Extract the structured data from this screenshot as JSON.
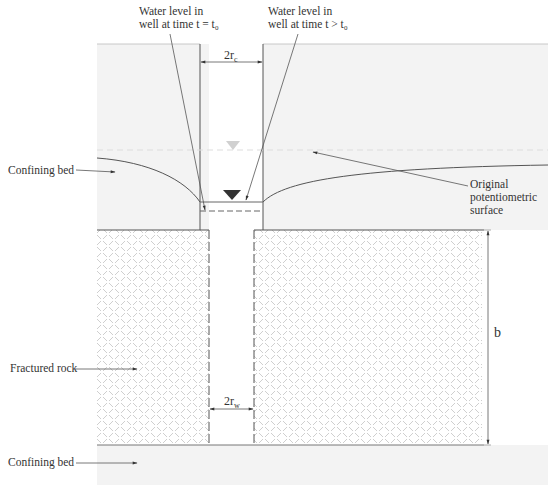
{
  "labels": {
    "water_level_t0_line1": "Water level in",
    "water_level_t0_line2": "well at time t = t₀",
    "water_level_t_line1": "Water level in",
    "water_level_t_line2": "well at time t > t₀",
    "casing_radius": "2r",
    "casing_radius_sub": "c",
    "well_radius": "2r",
    "well_radius_sub": "w",
    "confining_bed_top": "Confining bed",
    "confining_bed_bottom": "Confining bed",
    "original_surface_line1": "Original",
    "original_surface_line2": "potentiometric",
    "original_surface_line3": "surface",
    "fractured_rock": "Fractured rock",
    "aquifer_thickness": "b"
  },
  "colors": {
    "confining_bed_fill": "#f3f3f3",
    "hatch_stroke": "#cfcfcf",
    "line": "#555555",
    "water_marker_dark": "#333333",
    "water_marker_light": "#cccccc"
  }
}
